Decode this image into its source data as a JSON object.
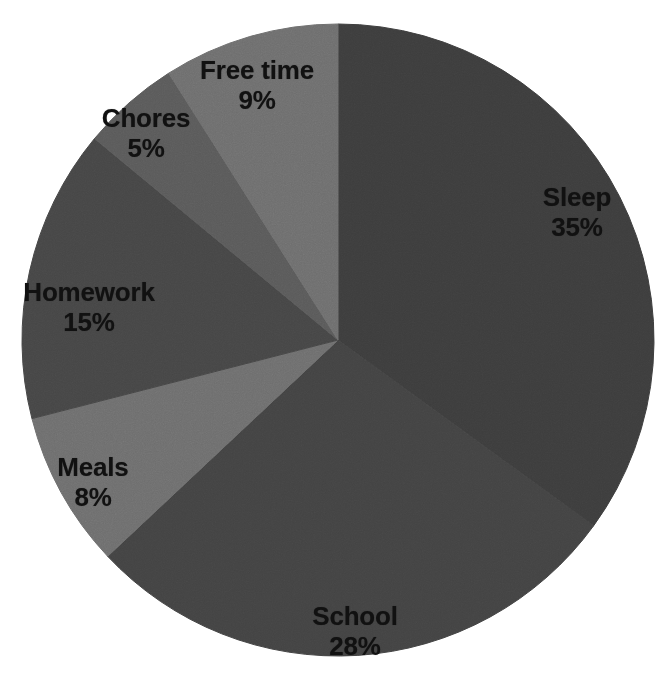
{
  "chart_data": {
    "type": "pie",
    "title": "",
    "subtitle": "",
    "xlabel": "",
    "ylabel": "",
    "legend_position": "none",
    "grid": false,
    "labels_inside_slices": true,
    "start_angle_deg": 0,
    "direction": "clockwise",
    "categories": [
      "Sleep",
      "School",
      "Meals",
      "Homework",
      "Chores",
      "Free time"
    ],
    "values": [
      35,
      28,
      8,
      15,
      5,
      9
    ],
    "value_suffix": "%",
    "total": 100,
    "slices": [
      {
        "name": "Sleep",
        "value": 35,
        "value_text": "35%",
        "color": "#3d3d3d",
        "start_angle": 0,
        "end_angle": 126,
        "label_x": 577,
        "label_y": 213
      },
      {
        "name": "School",
        "value": 28,
        "value_text": "28%",
        "color": "#434343",
        "start_angle": 126,
        "end_angle": 226.8,
        "label_x": 355,
        "label_y": 632
      },
      {
        "name": "Meals",
        "value": 8,
        "value_text": "8%",
        "color": "#6e6e6e",
        "start_angle": 226.8,
        "end_angle": 255.6,
        "label_x": 93,
        "label_y": 483
      },
      {
        "name": "Homework",
        "value": 15,
        "value_text": "15%",
        "color": "#464646",
        "start_angle": 255.6,
        "end_angle": 309.6,
        "label_x": 89,
        "label_y": 308
      },
      {
        "name": "Chores",
        "value": 5,
        "value_text": "5%",
        "color": "#5a5a5a",
        "start_angle": 309.6,
        "end_angle": 327.6,
        "label_x": 146,
        "label_y": 134
      },
      {
        "name": "Free time",
        "value": 9,
        "value_text": "9%",
        "color": "#6e6e6e",
        "start_angle": 327.6,
        "end_angle": 360,
        "label_x": 257,
        "label_y": 86
      }
    ],
    "geometry": {
      "center_x": 338,
      "center_y": 340,
      "radius": 316,
      "background_color": "#ffffff"
    }
  }
}
